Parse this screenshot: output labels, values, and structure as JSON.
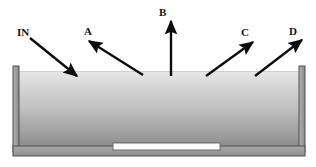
{
  "figure": {
    "canvas": {
      "width": 316,
      "height": 167,
      "background": "#ffffff"
    },
    "vessel": {
      "name": "open-top rectangular vessel",
      "wall_color": "#9b9b9b",
      "wall_outline": "#4a4a4a",
      "left_wall": {
        "x": 13,
        "y": 66,
        "width": 6,
        "height": 86
      },
      "right_wall": {
        "x": 299,
        "y": 66,
        "width": 6,
        "height": 86
      },
      "base": {
        "x": 13,
        "y": 146,
        "width": 292,
        "height": 10
      },
      "interior": {
        "x": 19,
        "y": 71,
        "width": 280,
        "height": 75
      }
    },
    "liquid": {
      "name": "liquid body",
      "surface_y": 71,
      "gradient_top": "#e6e6e6",
      "gradient_mid": "#c4c4c4",
      "gradient_bottom": "#8f8f8f"
    },
    "heater": {
      "name": "immersed heating element",
      "x": 113,
      "y": 143,
      "width": 107,
      "height": 7,
      "fill": "#ffffff",
      "stroke": "#6d6d6d"
    },
    "arrow_color": "#0d0d0d",
    "arrows": [
      {
        "id": "in",
        "label": "IN",
        "label_x": 17,
        "label_y": 36,
        "direction": "down-right",
        "description": "incoming stream entering the liquid surface",
        "x1": 30,
        "y1": 38,
        "x2": 77,
        "y2": 76
      },
      {
        "id": "a",
        "label": "A",
        "label_x": 84,
        "label_y": 35,
        "direction": "up-left",
        "description": "outgoing stream A leaving the surface toward upper left",
        "x1": 143,
        "y1": 75,
        "x2": 89,
        "y2": 41
      },
      {
        "id": "b",
        "label": "B",
        "label_x": 159,
        "label_y": 16,
        "direction": "up",
        "description": "outgoing stream B rising vertically from the surface",
        "x1": 171,
        "y1": 76,
        "x2": 171,
        "y2": 21
      },
      {
        "id": "c",
        "label": "C",
        "label_x": 241,
        "label_y": 36,
        "direction": "up-right",
        "description": "outgoing stream C leaving the surface toward upper right",
        "x1": 206,
        "y1": 76,
        "x2": 253,
        "y2": 42
      },
      {
        "id": "d",
        "label": "D",
        "label_x": 289,
        "label_y": 35,
        "direction": "up-right",
        "description": "outgoing stream D leaving the surface toward upper right",
        "x1": 255,
        "y1": 76,
        "x2": 302,
        "y2": 40
      }
    ]
  }
}
